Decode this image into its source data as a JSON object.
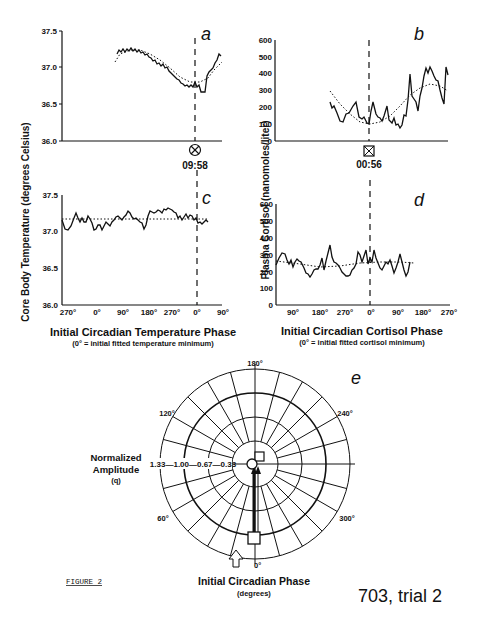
{
  "chart_data": [
    {
      "panel": "a",
      "type": "line",
      "ylabel": "Core Body Temperature (degrees Celsius)",
      "yticks": [
        "36.0",
        "36.5",
        "37.0",
        "37.5"
      ],
      "ylim": [
        36.0,
        37.5
      ],
      "marker_label": "09:58",
      "marker_symbol": "circle-x",
      "series": [
        {
          "name": "observed",
          "style": "solid",
          "x": [
            0.2,
            0.24,
            0.28,
            0.32,
            0.36,
            0.4,
            0.44,
            0.48,
            0.52,
            0.56,
            0.6,
            0.64,
            0.68,
            0.72,
            0.76,
            0.8,
            0.84,
            0.86,
            0.88,
            0.9,
            0.92,
            0.94,
            0.96,
            0.98
          ],
          "values": [
            37.15,
            37.19,
            37.2,
            37.21,
            37.2,
            37.18,
            37.16,
            37.12,
            37.06,
            37.01,
            36.98,
            36.92,
            36.86,
            36.8,
            36.75,
            36.73,
            36.72,
            36.8,
            36.67,
            36.67,
            36.93,
            37.0,
            37.08,
            37.18
          ]
        },
        {
          "name": "fitted",
          "style": "dotted",
          "x": [
            0.2,
            0.3,
            0.4,
            0.5,
            0.6,
            0.7,
            0.8,
            0.86,
            0.92,
            0.98
          ],
          "values": [
            37.1,
            37.2,
            37.18,
            37.1,
            36.98,
            36.82,
            36.72,
            36.73,
            36.88,
            37.1
          ]
        }
      ]
    },
    {
      "panel": "b",
      "type": "line",
      "ylabel": "Plasma Cortisol (nanomoles/liter)",
      "yticks": [
        "0",
        "100",
        "200",
        "300",
        "400",
        "500",
        "600"
      ],
      "ylim": [
        0,
        600
      ],
      "marker_label": "00:56",
      "marker_symbol": "square-x",
      "series": [
        {
          "name": "observed",
          "style": "solid",
          "x": [
            0.32,
            0.34,
            0.37,
            0.4,
            0.43,
            0.46,
            0.49,
            0.52,
            0.55,
            0.57,
            0.6,
            0.62,
            0.64,
            0.66,
            0.68,
            0.7,
            0.72,
            0.74,
            0.76,
            0.78,
            0.8,
            0.82,
            0.84,
            0.86,
            0.88,
            0.9,
            0.92,
            0.94,
            0.96,
            0.97
          ],
          "values": [
            230,
            190,
            110,
            150,
            220,
            140,
            100,
            220,
            130,
            110,
            200,
            90,
            130,
            80,
            70,
            220,
            390,
            240,
            180,
            430,
            430,
            380,
            360,
            300,
            220,
            430,
            380,
            410,
            380,
            390
          ]
        },
        {
          "name": "fitted",
          "style": "dotted",
          "x": [
            0.32,
            0.4,
            0.48,
            0.56,
            0.64,
            0.72,
            0.8,
            0.88,
            0.96
          ],
          "values": [
            290,
            200,
            130,
            100,
            130,
            220,
            300,
            330,
            290
          ]
        }
      ]
    },
    {
      "panel": "c",
      "type": "line",
      "xlabel": "Initial Circadian Temperature Phase",
      "xsublabel": "(0° = initial fitted temperature minimum)",
      "xticks": [
        "270°",
        "0°",
        "90°",
        "180°",
        "270°",
        "0°",
        "90°"
      ],
      "ylim": [
        36.0,
        37.5
      ],
      "yticks": [
        "36.0",
        "36.5",
        "37.0",
        "37.5"
      ],
      "series": [
        {
          "name": "observed",
          "style": "solid",
          "values": [
            37.05,
            37.0,
            37.1,
            37.22,
            37.1,
            37.0,
            37.15,
            37.02,
            37.08,
            37.15,
            37.12,
            37.16,
            37.14,
            37.22,
            37.1,
            37.05,
            37.25,
            37.24,
            37.28,
            37.22,
            37.15,
            37.18,
            37.12,
            37.1,
            37.14
          ]
        },
        {
          "name": "fitted",
          "style": "dotted",
          "values": [
            37.14,
            37.14
          ]
        }
      ]
    },
    {
      "panel": "d",
      "type": "line",
      "xlabel": "Initial Circadian Cortisol Phase",
      "xsublabel": "(0° = initial fitted cortisol minimum)",
      "xticks": [
        "90°",
        "180°",
        "270°",
        "0°",
        "90°",
        "180°",
        "270°"
      ],
      "ylim": [
        0,
        600
      ],
      "yticks": [
        "0",
        "100",
        "200",
        "300",
        "400",
        "500",
        "600"
      ],
      "series": [
        {
          "name": "observed",
          "style": "solid",
          "values": [
            240,
            300,
            230,
            270,
            260,
            190,
            170,
            270,
            330,
            200,
            440,
            280,
            250,
            180,
            160,
            230,
            390,
            270,
            390,
            300,
            220,
            280,
            260,
            200,
            390,
            220,
            170,
            270
          ]
        },
        {
          "name": "fitted",
          "style": "dotted",
          "values": [
            260,
            245,
            255,
            265,
            250
          ]
        }
      ]
    },
    {
      "panel": "e",
      "type": "polar",
      "radial_label": "Normalized Amplitude",
      "radial_sublabel": "(q)",
      "radial_ticks": [
        "1.33",
        "1.00",
        "0.67",
        "0.33"
      ],
      "angular_ticks": [
        "0°",
        "60°",
        "120°",
        "180°",
        "240°",
        "300°"
      ],
      "angular_label": "Initial Circadian Phase",
      "angular_sublabel": "(degrees)",
      "points": [
        {
          "name": "temperature",
          "marker": "circle",
          "phase_deg": 0,
          "amplitude": 0.05
        },
        {
          "name": "cortisol",
          "marker": "square",
          "phase_deg": 180,
          "amplitude": 0.12
        },
        {
          "name": "stimulus",
          "marker": "square",
          "phase_deg": 0,
          "amplitude": 1.0
        }
      ]
    }
  ],
  "labels": {
    "a": "a",
    "b": "b",
    "c": "c",
    "d": "d",
    "e": "e",
    "temp_ylabel": "Core Body Temperature (degrees Celsius)",
    "cort_ylabel": "Plasma Cortisol (nanomoles/liter)",
    "marker_a": "09:58",
    "marker_b": "00:56",
    "c_xlabel": "Initial Circadian Temperature Phase",
    "c_xsub": "(0° = initial fitted temperature minimum)",
    "d_xlabel": "Initial Circadian Cortisol Phase",
    "d_xsub": "(0° = initial fitted cortisol minimum)",
    "e_amp1": "Normalized",
    "e_amp2": "Amplitude",
    "e_amp3": "(q)",
    "e_radial": "1.33—1.00—0.67—0.33",
    "e_xlabel": "Initial Circadian Phase",
    "e_xsub": "(degrees)",
    "ang_180": "180°",
    "ang_120": "120°",
    "ang_240": "240°",
    "ang_60": "60°",
    "ang_300": "300°",
    "ang_0": "0°",
    "figure": "FIGURE 2",
    "trial": "703, trial 2"
  },
  "ticks": {
    "temp": [
      "37.5",
      "37.0",
      "36.5",
      "36.0"
    ],
    "cort": [
      "600",
      "500",
      "400",
      "300",
      "200",
      "100",
      "0"
    ],
    "c_x": [
      "270°",
      "0°",
      "90°",
      "180°",
      "270°",
      "0°",
      "90°"
    ],
    "d_x": [
      "90°",
      "180°",
      "270°",
      "0°",
      "90°",
      "180°",
      "270°"
    ]
  }
}
